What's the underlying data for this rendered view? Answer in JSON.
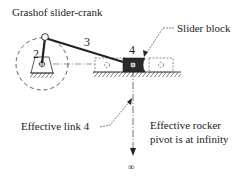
{
  "title": "Grashof slider-crank",
  "labels": {
    "crank": "2",
    "coupler": "3",
    "slider": "4",
    "slider_block": "Slider block",
    "effective_link": "Effective link 4",
    "rocker_line1": "Effective rocker",
    "rocker_line2": "pivot is at infinity",
    "infinity": "∞"
  },
  "colors": {
    "ink": "#222222",
    "slider_fill": "#2a2a2a",
    "background": "#ffffff"
  }
}
